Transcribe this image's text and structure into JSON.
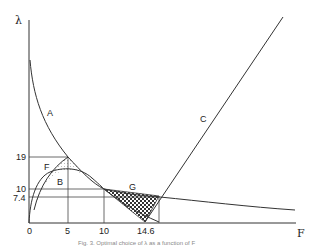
{
  "figure": {
    "y_axis_label": "λ",
    "x_axis_label": "F",
    "caption": "Fig. 3. Optimal choice of λ as a function of F",
    "y_ticks": [
      "19",
      "10",
      "7.4"
    ],
    "x_ticks": [
      "0",
      "5",
      "10",
      "14.6"
    ],
    "curve_labels": {
      "A": "A",
      "B": "B",
      "C": "C",
      "F": "F",
      "G": "G"
    }
  },
  "colors": {
    "line": "#333333",
    "background": "#ffffff"
  }
}
